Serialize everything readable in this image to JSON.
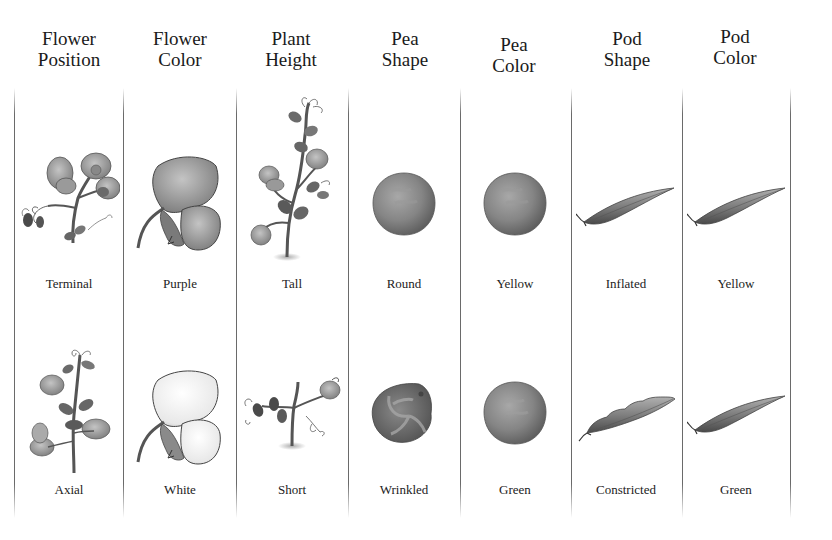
{
  "columns": [
    {
      "header_line1": "Flower",
      "header_line2": "Position",
      "dominant": "Terminal",
      "recessive": "Axial"
    },
    {
      "header_line1": "Flower",
      "header_line2": "Color",
      "dominant": "Purple",
      "recessive": "White"
    },
    {
      "header_line1": "Plant",
      "header_line2": "Height",
      "dominant": "Tall",
      "recessive": "Short"
    },
    {
      "header_line1": "Pea",
      "header_line2": "Shape",
      "dominant": "Round",
      "recessive": "Wrinkled"
    },
    {
      "header_line1": "Pea",
      "header_line2": "Color",
      "dominant": "Yellow",
      "recessive": "Green"
    },
    {
      "header_line1": "Pod",
      "header_line2": "Shape",
      "dominant": "Inflated",
      "recessive": "Constricted"
    },
    {
      "header_line1": "Pod",
      "header_line2": "Color",
      "dominant": "Yellow",
      "recessive": "Green"
    }
  ],
  "colors": {
    "ink": "#1a1a1a",
    "divider": "#6a6a6a",
    "illustration_gray": "#8a8a8a"
  }
}
